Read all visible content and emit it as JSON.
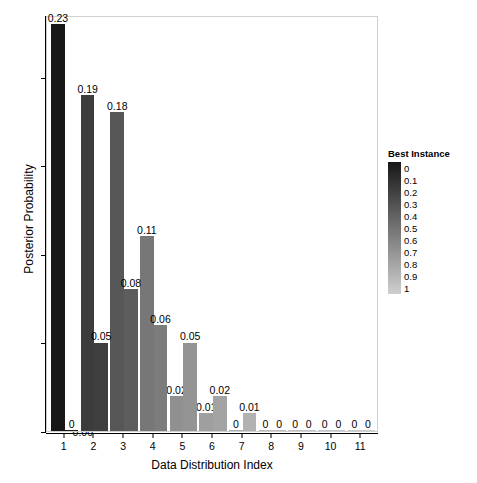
{
  "chart_data": {
    "type": "bar",
    "title": "",
    "xlabel": "Data Distribution Index",
    "ylabel": "Posterior Probability",
    "categories": [
      "1",
      "2",
      "3",
      "4",
      "5",
      "6",
      "7",
      "8",
      "9",
      "10",
      "11"
    ],
    "xlim": [
      0.4,
      11.6
    ],
    "ylim": [
      0,
      0.235
    ],
    "ytick_values": [
      0.0,
      0.05,
      0.1,
      0.15,
      0.2
    ],
    "ytick_labels": [
      "0.00",
      "0.05",
      "0.10",
      "0.15",
      "0.20"
    ],
    "grid": false,
    "legend_position": "right",
    "series": [
      {
        "name": "bar-a",
        "values": [
          0.23,
          0.19,
          0.18,
          0.11,
          0.02,
          0.01,
          0.0,
          0.0,
          0.0,
          0.0,
          0.0
        ],
        "labels": [
          "0.23",
          "0.19",
          "0.18",
          "0.11",
          "0.02",
          "0.01",
          "0",
          "0",
          "0",
          "0",
          "0"
        ],
        "best_instance": [
          0.0,
          0.2,
          0.35,
          0.52,
          0.66,
          0.74,
          0.82,
          0.88,
          0.92,
          0.95,
          0.97
        ]
      },
      {
        "name": "bar-b",
        "values": [
          0.0,
          0.05,
          0.08,
          0.06,
          0.05,
          0.02,
          0.01,
          0.0,
          0.0,
          0.0,
          0.0
        ],
        "labels": [
          "0",
          "0.05",
          "0.08",
          "0.06",
          "0.05",
          "0.02",
          "0.01",
          "0",
          "0",
          "0",
          "0"
        ],
        "best_instance": [
          0.02,
          0.22,
          0.38,
          0.55,
          0.68,
          0.76,
          0.84,
          0.9,
          0.94,
          0.96,
          0.98
        ]
      }
    ],
    "legend": {
      "title": "Best Instance",
      "tick_labels": [
        "0",
        "0.1",
        "0.2",
        "0.3",
        "0.4",
        "0.5",
        "0.6",
        "0.7",
        "0.8",
        "0.9",
        "1"
      ],
      "tick_values": [
        0,
        0.1,
        0.2,
        0.3,
        0.4,
        0.5,
        0.6,
        0.7,
        0.8,
        0.9,
        1
      ],
      "gradient_from": "#171717",
      "gradient_to": "#cfcfcf"
    },
    "colors": {
      "background": "#ffffff",
      "panel_border": "#d0d0d0",
      "axis": "#000000",
      "text": "#000000"
    }
  }
}
